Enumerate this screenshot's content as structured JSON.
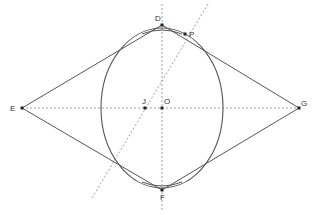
{
  "diagram": {
    "type": "geometry-construction",
    "points": [
      {
        "id": "D",
        "label": "D",
        "x": 162,
        "y": 25
      },
      {
        "id": "P",
        "label": "P",
        "x": 185,
        "y": 34
      },
      {
        "id": "E",
        "label": "E",
        "x": 22,
        "y": 108
      },
      {
        "id": "J",
        "label": "J",
        "x": 145,
        "y": 108
      },
      {
        "id": "O",
        "label": "O",
        "x": 162,
        "y": 108
      },
      {
        "id": "G",
        "label": "G",
        "x": 299,
        "y": 108
      },
      {
        "id": "F",
        "label": "F",
        "x": 162,
        "y": 190
      }
    ],
    "ellipse": {
      "cx": 162,
      "cy": 108,
      "rx": 61,
      "ry": 78
    },
    "rhombus": [
      "D",
      "G",
      "F",
      "E"
    ],
    "dashed_lines": [
      {
        "name": "vertical-axis",
        "x1": 162,
        "y1": 4,
        "x2": 162,
        "y2": 211
      },
      {
        "name": "horizontal-axis",
        "x1": 22,
        "y1": 108,
        "x2": 299,
        "y2": 108
      },
      {
        "name": "oblique-line-jp",
        "x1": 208,
        "y1": 4,
        "x2": 92,
        "y2": 198
      }
    ],
    "colors": {
      "stroke": "#555555",
      "dashed": "#888888",
      "point": "#222222",
      "label": "#333333"
    }
  }
}
